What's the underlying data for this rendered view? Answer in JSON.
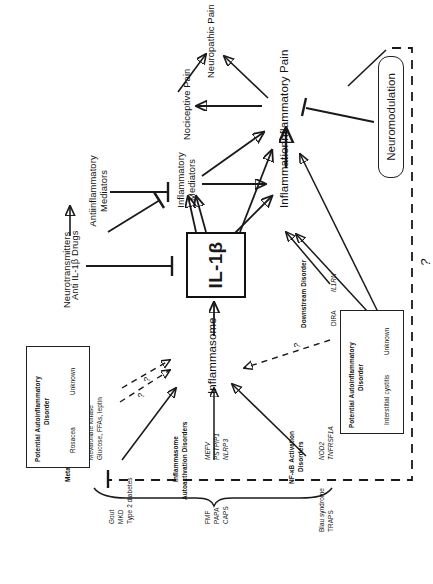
{
  "figure": {
    "type": "pathway-diagram",
    "center_node": "IL-1β",
    "question_mark": "?",
    "nodes": {
      "inflammasome": "Inflammasome",
      "il1b": "IL-1β",
      "inflammation": "Inflammation",
      "inflammatory_pain": "Inflammatory Pain",
      "inflammatory_mediators_l1": "Inflammatory",
      "inflammatory_mediators_l2": "Mediators",
      "antiinflammatory_l1": "Antiinflammatory",
      "antiinflammatory_l2": "Mediators",
      "neurotransmitters": "Neurotransmitters",
      "anti_il1b_drugs": "Anti IL-1β Drugs",
      "nociceptive_pain": "Nociceptive Pain",
      "neuropathic_pain": "Neuropathic Pain",
      "neuromodulation": "Neuromodulation"
    },
    "groups": [
      {
        "id": "metabolic",
        "heading_line1": "Metabolic Disorders",
        "diseases": [
          "Gout",
          "MKD",
          "Type 2 diabetes"
        ],
        "triggers": [
          "MSU crystals and FFAs",
          "Mevalonate kinase",
          "Glucose, FFAs, leptin"
        ]
      },
      {
        "id": "inflammasome-autoactivation",
        "heading_line1": "Inflammasome",
        "heading_line2": "Autoactivation Disorders",
        "diseases": [
          "FMF",
          "PAPA",
          "CAPS"
        ],
        "triggers": [
          "MEFV",
          "PSTPIP1",
          "NLRP3"
        ]
      },
      {
        "id": "nfkb-activation",
        "heading_line1": "NF-κВ Activation",
        "heading_line2": "Disorders",
        "diseases": [
          "Blau syndrome",
          "TRAPS"
        ],
        "triggers": [
          "NOD2",
          "TNFRSF1A"
        ]
      },
      {
        "id": "downstream",
        "heading_line1": "Downstream Disorder",
        "diseases": [
          "DIRA"
        ],
        "triggers": [
          "IL1RN"
        ]
      }
    ],
    "boxes": [
      {
        "id": "potential-rosacea",
        "heading_line1": "Potential Autoinflammatory",
        "heading_line2": "Disorder",
        "disease": "Rosacea",
        "trigger": "Unknown"
      },
      {
        "id": "potential-interstitial-cystitis",
        "heading_line1": "Potential Autoinflammatory",
        "heading_line2": "Disorder",
        "disease": "Interstitial cystitis",
        "trigger": "Unknown"
      }
    ],
    "edge_labels": [
      "?",
      "?",
      "?"
    ]
  }
}
